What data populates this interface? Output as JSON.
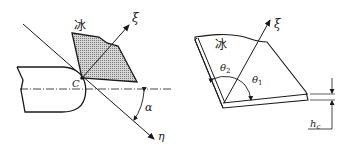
{
  "figure_left": {
    "ice_label": "冰",
    "xi_label": "ξ",
    "eta_label": "η",
    "point_label": "C",
    "angle_label": "α"
  },
  "figure_right": {
    "ice_label": "冰",
    "xi_label": "ξ",
    "theta1_label": "θ",
    "theta1_sub": "1",
    "theta2_label": "θ",
    "theta2_sub": "2",
    "thickness_label": "h",
    "thickness_sub": "c"
  },
  "colors": {
    "line": "#1a1a1a",
    "hatch_fill": "#c8c8c8",
    "background": "#ffffff"
  }
}
